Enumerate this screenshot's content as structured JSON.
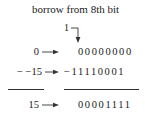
{
  "title": "borrow from 8th bit",
  "carry": "1",
  "rows": [
    {
      "label": "0",
      "bits": "00000000"
    },
    {
      "label": "− −15",
      "bits": "−11110001"
    },
    {
      "label": "15",
      "bits": "00001111"
    }
  ]
}
